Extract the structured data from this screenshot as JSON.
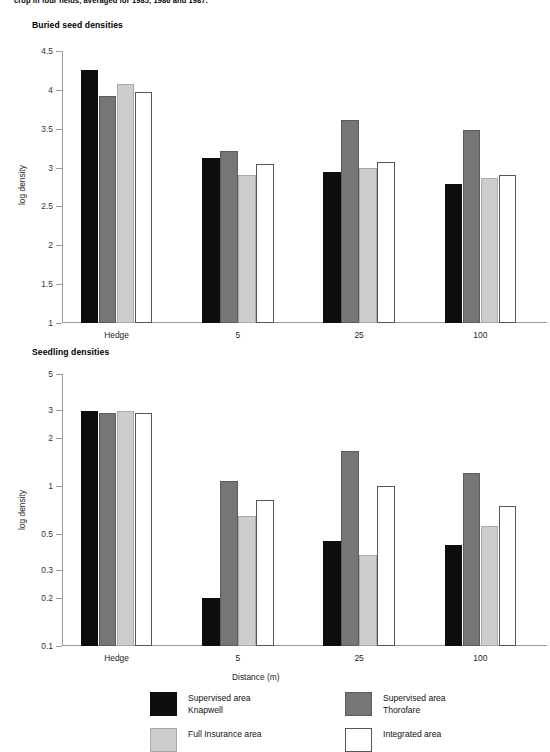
{
  "caption": "crop in four fields, averaged for 1985, 1986 and 1987.",
  "panels": [
    {
      "title": "Buried seed densities"
    },
    {
      "title": "Seedling densities"
    }
  ],
  "axis": {
    "ylabel": "log density",
    "xlabel": "Distance (m)"
  },
  "legend": {
    "items": [
      {
        "key": "s0",
        "line1": "Supervised area",
        "line2": "Knapwell"
      },
      {
        "key": "s1",
        "line1": "Supervised area",
        "line2": "Thorofare"
      },
      {
        "key": "s2",
        "line1": "Full Insurance area",
        "line2": ""
      },
      {
        "key": "s3",
        "line1": "Integrated area",
        "line2": ""
      }
    ]
  },
  "chart_data": [
    {
      "type": "bar",
      "title": "Buried seed densities",
      "xlabel": "",
      "ylabel": "log density",
      "scale": "linear",
      "ylim": [
        1,
        4.5
      ],
      "yticks": [
        1,
        1.5,
        2,
        2.5,
        3,
        3.5,
        4,
        4.5
      ],
      "ytick_labels": [
        "1",
        "1.5",
        "2",
        "2.5",
        "3",
        "3.5",
        "4",
        "4.5"
      ],
      "grid": false,
      "legend_position": "below-figure",
      "categories": [
        "Hedge",
        "5",
        "25",
        "100"
      ],
      "series": [
        {
          "name": "Supervised area Knapwell",
          "values": [
            4.25,
            3.12,
            2.94,
            2.79
          ]
        },
        {
          "name": "Supervised area Thorofare",
          "values": [
            3.92,
            3.21,
            3.61,
            3.48
          ]
        },
        {
          "name": "Full Insurance area",
          "values": [
            4.08,
            2.9,
            3.0,
            2.87
          ]
        },
        {
          "name": "Integrated area",
          "values": [
            3.97,
            3.04,
            3.07,
            2.9
          ]
        }
      ]
    },
    {
      "type": "bar",
      "title": "Seedling densities",
      "xlabel": "Distance (m)",
      "ylabel": "log density",
      "scale": "log",
      "ylim": [
        0.1,
        5
      ],
      "yticks": [
        0.1,
        0.2,
        0.3,
        0.5,
        1,
        2,
        3,
        5
      ],
      "ytick_labels": [
        "0.1",
        "0.2",
        "0.3",
        "0.5",
        "1",
        "2",
        "3",
        "5"
      ],
      "grid": false,
      "legend_position": "below-figure",
      "categories": [
        "Hedge",
        "5",
        "25",
        "100"
      ],
      "series": [
        {
          "name": "Supervised area Knapwell",
          "values": [
            2.95,
            0.2,
            0.45,
            0.43
          ]
        },
        {
          "name": "Supervised area Thorofare",
          "values": [
            2.85,
            1.08,
            1.65,
            1.2
          ]
        },
        {
          "name": "Full Insurance area",
          "values": [
            2.95,
            0.65,
            0.37,
            0.56
          ]
        },
        {
          "name": "Integrated area",
          "values": [
            2.85,
            0.82,
            1.0,
            0.75
          ]
        }
      ]
    }
  ]
}
